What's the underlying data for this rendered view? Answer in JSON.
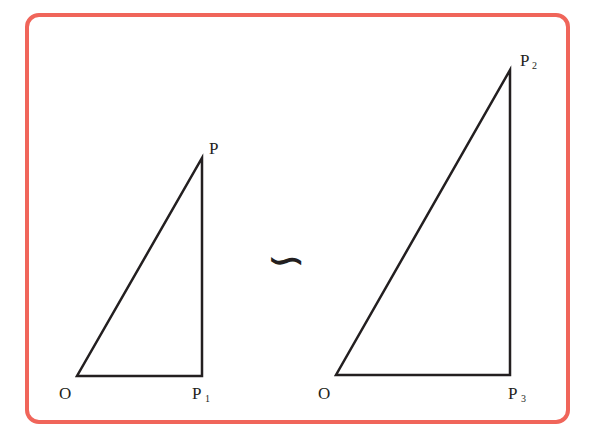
{
  "diagram": {
    "type": "similar-triangles",
    "border_color": "#F0655A",
    "line_color": "#231f20",
    "similarity_symbol": "∽",
    "left_triangle": {
      "vertices": {
        "O": {
          "label": "O",
          "subscript": ""
        },
        "P1": {
          "label": "P",
          "subscript": "1"
        },
        "P": {
          "label": "P",
          "subscript": ""
        }
      }
    },
    "right_triangle": {
      "vertices": {
        "O": {
          "label": "O",
          "subscript": ""
        },
        "P3": {
          "label": "P",
          "subscript": "3"
        },
        "P2": {
          "label": "P",
          "subscript": "2"
        }
      }
    }
  }
}
